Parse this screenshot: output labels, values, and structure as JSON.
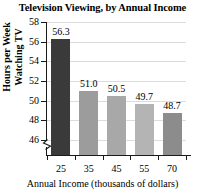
{
  "chart_data": {
    "type": "bar",
    "title": "Television Viewing, by Annual Income",
    "xlabel": "Annual Income (thousands of dollars)",
    "ylabel_lines": [
      "Hours per Week",
      "Watching TV"
    ],
    "ylabel": "Hours per Week Watching TV",
    "categories": [
      "25",
      "35",
      "45",
      "55",
      "70"
    ],
    "values": [
      56.3,
      51.0,
      50.5,
      49.7,
      48.7
    ],
    "value_labels": [
      "56.3",
      "51.0",
      "50.5",
      "49.7",
      "48.7"
    ],
    "bar_colors": [
      "#3a3a3a",
      "#9c9c9c",
      "#a8a8a8",
      "#b4b4b4",
      "#8c8c8c"
    ],
    "ylim": [
      46,
      58
    ],
    "yticks": [
      58,
      56,
      54,
      52,
      50,
      48,
      46
    ],
    "ytick_labels": [
      "58",
      "56",
      "54",
      "52",
      "50",
      "48",
      "46"
    ],
    "grid": true,
    "grid_color": "#dcdcdc",
    "axis_color": "#1a1a1a",
    "axis_break": true,
    "legend": null,
    "background": "#ffffff"
  }
}
